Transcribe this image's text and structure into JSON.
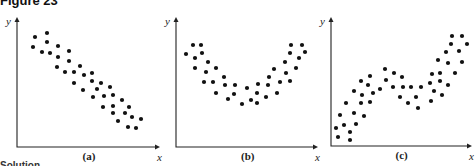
{
  "figure": {
    "title": "Figure 23",
    "footer_cutoff": "Solution"
  },
  "chart_data": [
    {
      "type": "scatter",
      "label": "(a)",
      "xlabel": "x",
      "ylabel": "y",
      "grid": false,
      "description": "Negative linear relationship",
      "axes": {
        "origin": [
          17,
          147
        ],
        "x_end": 160,
        "y_end": 17
      },
      "points": [
        [
          35,
          37
        ],
        [
          47,
          33
        ],
        [
          33,
          47
        ],
        [
          47,
          42
        ],
        [
          42,
          52
        ],
        [
          50,
          53
        ],
        [
          58,
          46
        ],
        [
          69,
          51
        ],
        [
          58,
          57
        ],
        [
          69,
          61
        ],
        [
          57,
          67
        ],
        [
          65,
          72
        ],
        [
          74,
          72
        ],
        [
          80,
          66
        ],
        [
          84,
          75
        ],
        [
          92,
          73
        ],
        [
          74,
          83
        ],
        [
          92,
          81
        ],
        [
          101,
          83
        ],
        [
          83,
          90
        ],
        [
          97,
          89
        ],
        [
          110,
          87
        ],
        [
          93,
          97
        ],
        [
          104,
          96
        ],
        [
          113,
          95
        ],
        [
          122,
          100
        ],
        [
          103,
          107
        ],
        [
          113,
          106
        ],
        [
          129,
          107
        ],
        [
          113,
          113
        ],
        [
          125,
          113
        ],
        [
          132,
          117
        ],
        [
          141,
          119
        ],
        [
          118,
          121
        ],
        [
          128,
          127
        ],
        [
          136,
          128
        ]
      ]
    },
    {
      "type": "scatter",
      "label": "(b)",
      "xlabel": "x",
      "ylabel": "y",
      "grid": false,
      "description": "Nonlinear (U-shaped / quadratic) relationship",
      "axes": {
        "origin": [
          176,
          147
        ],
        "x_end": 318,
        "y_end": 17
      },
      "points": [
        [
          186,
          54
        ],
        [
          193,
          45
        ],
        [
          201,
          45
        ],
        [
          202,
          53
        ],
        [
          195,
          58
        ],
        [
          208,
          62
        ],
        [
          195,
          68
        ],
        [
          206,
          72
        ],
        [
          216,
          68
        ],
        [
          204,
          82
        ],
        [
          213,
          82
        ],
        [
          224,
          77
        ],
        [
          225,
          85
        ],
        [
          216,
          93
        ],
        [
          235,
          85
        ],
        [
          228,
          99
        ],
        [
          234,
          94
        ],
        [
          247,
          88
        ],
        [
          242,
          104
        ],
        [
          251,
          100
        ],
        [
          257,
          103
        ],
        [
          258,
          84
        ],
        [
          257,
          93
        ],
        [
          266,
          97
        ],
        [
          269,
          77
        ],
        [
          268,
          85
        ],
        [
          274,
          69
        ],
        [
          277,
          93
        ],
        [
          280,
          82
        ],
        [
          286,
          73
        ],
        [
          285,
          62
        ],
        [
          290,
          53
        ],
        [
          291,
          45
        ],
        [
          290,
          81
        ],
        [
          296,
          68
        ],
        [
          299,
          58
        ],
        [
          302,
          45
        ],
        [
          305,
          52
        ]
      ]
    },
    {
      "type": "scatter",
      "label": "(c)",
      "xlabel": "x",
      "ylabel": "y",
      "grid": false,
      "description": "Nonlinear (cubic-like) relationship",
      "axes": {
        "origin": [
          331,
          146
        ],
        "x_end": 472,
        "y_end": 17
      },
      "points": [
        [
          336,
          128
        ],
        [
          338,
          137
        ],
        [
          340,
          115
        ],
        [
          344,
          125
        ],
        [
          346,
          103
        ],
        [
          350,
          132
        ],
        [
          350,
          140
        ],
        [
          354,
          91
        ],
        [
          354,
          113
        ],
        [
          356,
          124
        ],
        [
          361,
          81
        ],
        [
          362,
          95
        ],
        [
          361,
          103
        ],
        [
          364,
          116
        ],
        [
          368,
          85
        ],
        [
          370,
          76
        ],
        [
          373,
          93
        ],
        [
          370,
          102
        ],
        [
          380,
          89
        ],
        [
          385,
          69
        ],
        [
          386,
          80
        ],
        [
          394,
          73
        ],
        [
          393,
          87
        ],
        [
          402,
          77
        ],
        [
          403,
          87
        ],
        [
          400,
          97
        ],
        [
          408,
          103
        ],
        [
          411,
          87
        ],
        [
          416,
          97
        ],
        [
          418,
          108
        ],
        [
          421,
          87
        ],
        [
          430,
          83
        ],
        [
          432,
          74
        ],
        [
          431,
          101
        ],
        [
          434,
          91
        ],
        [
          440,
          81
        ],
        [
          440,
          73
        ],
        [
          442,
          95
        ],
        [
          438,
          60
        ],
        [
          448,
          63
        ],
        [
          448,
          85
        ],
        [
          446,
          52
        ],
        [
          451,
          44
        ],
        [
          452,
          36
        ],
        [
          455,
          73
        ],
        [
          459,
          51
        ],
        [
          462,
          36
        ],
        [
          462,
          62
        ],
        [
          467,
          44
        ]
      ]
    }
  ]
}
